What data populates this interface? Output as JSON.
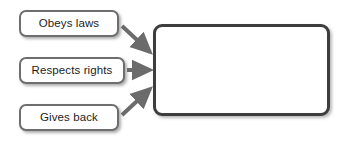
{
  "diagram": {
    "type": "flowchart",
    "background_color": "#ffffff",
    "node_border_color": "#6e6e6e",
    "target_border_color": "#3d3d3d",
    "arrow_color": "#6b6b6b",
    "sources": [
      {
        "id": "obeys-laws",
        "label": "Obeys laws"
      },
      {
        "id": "respects-rights",
        "label": "Respects rights"
      },
      {
        "id": "gives-back",
        "label": "Gives back"
      }
    ],
    "target": {
      "id": "target",
      "label": ""
    },
    "connections": [
      {
        "from": "obeys-laws",
        "to": "target"
      },
      {
        "from": "respects-rights",
        "to": "target"
      },
      {
        "from": "gives-back",
        "to": "target"
      }
    ]
  }
}
